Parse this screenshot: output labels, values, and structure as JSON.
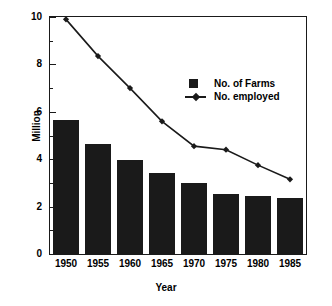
{
  "chart_data": {
    "type": "bar",
    "title": "",
    "xlabel": "Year",
    "ylabel": "Million",
    "categories": [
      "1950",
      "1955",
      "1960",
      "1965",
      "1970",
      "1975",
      "1980",
      "1985"
    ],
    "ylim": [
      0,
      10
    ],
    "xlim": [
      1947.5,
      1987.5
    ],
    "ytick_labels": [
      "0",
      "2",
      "4",
      "6",
      "8",
      "10"
    ],
    "ytick_values": [
      0,
      2,
      4,
      6,
      8,
      10
    ],
    "yminor_values": [
      1,
      3,
      5,
      7,
      9
    ],
    "grid": false,
    "legend_position": "upper right",
    "series": [
      {
        "name": "No. of Farms",
        "type": "bar",
        "color": "#1a1a1a",
        "values": [
          5.65,
          4.65,
          3.95,
          3.4,
          3.0,
          2.55,
          2.45,
          2.35
        ]
      },
      {
        "name": "No. employed",
        "type": "line",
        "color": "#1a1a1a",
        "marker": "diamond",
        "values": [
          9.9,
          8.35,
          7.0,
          5.6,
          4.55,
          4.4,
          3.75,
          3.15
        ]
      }
    ]
  },
  "legend": {
    "items": [
      {
        "label": "No. of Farms",
        "marker": "filled-square"
      },
      {
        "label": "No. employed",
        "marker": "line-diamond"
      }
    ]
  },
  "axes": {
    "y_title": "Million",
    "x_title": "Year"
  }
}
